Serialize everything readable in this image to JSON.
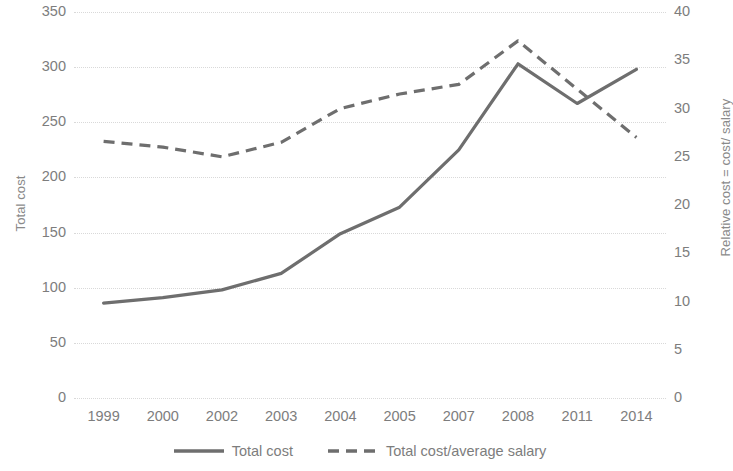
{
  "chart_data": {
    "type": "line",
    "title": "",
    "xlabel": "",
    "categories": [
      "1999",
      "2000",
      "2002",
      "2003",
      "2004",
      "2005",
      "2007",
      "2008",
      "2011",
      "2014"
    ],
    "grid": true,
    "legend_position": "bottom",
    "series": [
      {
        "name": "Total cost",
        "axis": "left",
        "style": "solid",
        "color": "#6e6e6e",
        "values": [
          86,
          91,
          98,
          113,
          149,
          173,
          225,
          303,
          267,
          298
        ]
      },
      {
        "name": "Total cost/average salary",
        "axis": "right",
        "style": "dashed",
        "color": "#6e6e6e",
        "values": [
          26.6,
          26.0,
          25.0,
          26.5,
          30.0,
          31.5,
          32.5,
          37.0,
          32.0,
          27.0
        ]
      }
    ],
    "axes": {
      "left": {
        "label": "Total cost",
        "min": 0,
        "max": 350,
        "step": 50,
        "ticks": [
          "0",
          "50",
          "100",
          "150",
          "200",
          "250",
          "300",
          "350"
        ]
      },
      "right": {
        "label": "Relative cost = cost/ salary",
        "min": 0,
        "max": 40,
        "step": 5,
        "ticks": [
          "0",
          "5",
          "10",
          "15",
          "20",
          "25",
          "30",
          "35",
          "40"
        ]
      }
    },
    "legend": [
      {
        "label": "Total cost",
        "marker": "solid-line-swatch"
      },
      {
        "label": "Total cost/average salary",
        "marker": "dashed-line-swatch"
      }
    ]
  }
}
